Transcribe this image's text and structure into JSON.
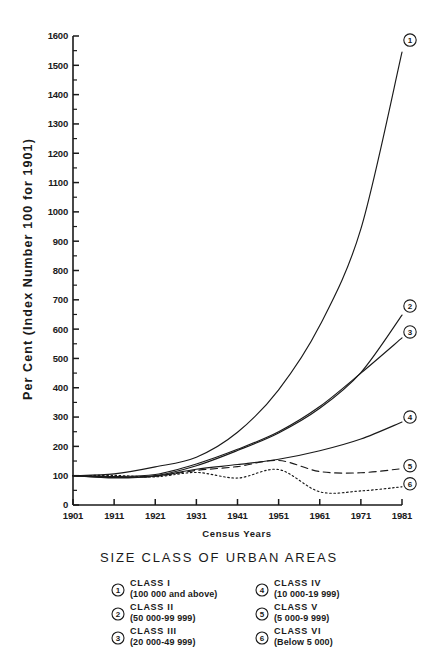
{
  "chart_data": {
    "type": "line",
    "title": "",
    "xlabel": "Census Years",
    "ylabel": "Per Cent (Index Number 100 for 1901)",
    "x": [
      1901,
      1911,
      1921,
      1931,
      1941,
      1951,
      1961,
      1971,
      1981
    ],
    "xtick_labels": [
      "1901",
      "1911",
      "1921",
      "1931",
      "1941",
      "1951",
      "1961",
      "1971",
      "1981"
    ],
    "ytick_labels": [
      "0",
      "100",
      "200",
      "300",
      "400",
      "500",
      "600",
      "700",
      "800",
      "900",
      "1000",
      "1100",
      "1200",
      "1300",
      "1400",
      "1500",
      "1600"
    ],
    "ylim": [
      0,
      1600
    ],
    "xlim": [
      1901,
      1981
    ],
    "ytick_step": 100,
    "yminor_step": 50,
    "grid": false,
    "legend_position": "below-plot",
    "series": [
      {
        "name": "1",
        "label": "CLASS I",
        "range": "(100 000 and above)",
        "style": "solid",
        "values": [
          100,
          106,
          130,
          163,
          248,
          393,
          612,
          942,
          1545
        ]
      },
      {
        "name": "2",
        "label": "CLASS II",
        "range": "(50 000-99 999)",
        "style": "solid",
        "values": [
          100,
          94,
          100,
          134,
          186,
          246,
          330,
          452,
          648
        ]
      },
      {
        "name": "3",
        "label": "CLASS III",
        "range": "(20 000-49 999)",
        "style": "solid",
        "values": [
          100,
          97,
          104,
          140,
          190,
          250,
          336,
          450,
          570
        ]
      },
      {
        "name": "4",
        "label": "CLASS IV",
        "range": "(10 000-19 999)",
        "style": "solid",
        "values": [
          100,
          92,
          98,
          122,
          138,
          156,
          185,
          225,
          283
        ]
      },
      {
        "name": "5",
        "label": "CLASS V",
        "range": "(5 000-9 999)",
        "style": "dashed",
        "values": [
          100,
          96,
          98,
          118,
          131,
          152,
          114,
          110,
          124
        ]
      },
      {
        "name": "6",
        "label": "CLASS VI",
        "range": "(Below 5 000)",
        "style": "dotted",
        "values": [
          100,
          101,
          96,
          111,
          92,
          121,
          45,
          48,
          62
        ]
      }
    ]
  },
  "legend": {
    "title": "SIZE CLASS OF URBAN AREAS",
    "entries": [
      {
        "num": "1",
        "label": "CLASS I",
        "range": "(100 000 and above)"
      },
      {
        "num": "2",
        "label": "CLASS II",
        "range": "(50 000-99 999)"
      },
      {
        "num": "3",
        "label": "CLASS III",
        "range": "(20 000-49 999)"
      },
      {
        "num": "4",
        "label": "CLASS IV",
        "range": "(10 000-19 999)"
      },
      {
        "num": "5",
        "label": "CLASS V",
        "range": "(5 000-9 999)"
      },
      {
        "num": "6",
        "label": "CLASS VI",
        "range": "(Below 5 000)"
      }
    ]
  },
  "colors": {
    "ink": "#1a1a1a",
    "background": "#ffffff"
  }
}
